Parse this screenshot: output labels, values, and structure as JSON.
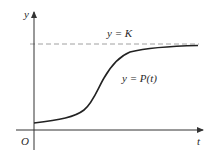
{
  "diagram": {
    "axes": {
      "x_label": "t",
      "y_label": "y",
      "origin_label": "O"
    },
    "asymptote": {
      "label": "y = K",
      "style": "dashed"
    },
    "curve": {
      "label": "y = P(t)",
      "shape": "sigmoid"
    },
    "colors": {
      "axis": "#333333",
      "curve": "#222222",
      "asymptote": "#999999",
      "text": "#2a2a2a"
    }
  }
}
